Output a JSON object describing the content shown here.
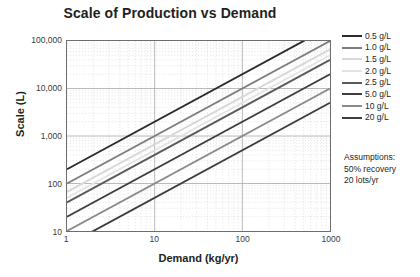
{
  "chart_data": {
    "type": "line",
    "title": "Scale of Production vs Demand",
    "xlabel": "Demand (kg/yr)",
    "ylabel": "Scale (L)",
    "xscale": "log",
    "yscale": "log",
    "xlim": [
      1,
      1000
    ],
    "ylim": [
      10,
      100000
    ],
    "xticks": [
      "1",
      "10",
      "100",
      "1000"
    ],
    "xtick_values": [
      1,
      10,
      100,
      1000
    ],
    "yticks": [
      "10",
      "100",
      "1,000",
      "10,000",
      "100,000"
    ],
    "ytick_values": [
      10,
      100,
      1000,
      10000,
      100000
    ],
    "grid": "major solid, minor dotted",
    "legend_position": "right outside",
    "series": [
      {
        "name": "0.5 g/L",
        "color": "#2b2b2b",
        "x": [
          1,
          1000
        ],
        "y": [
          200,
          200000
        ]
      },
      {
        "name": "1.0 g/L",
        "color": "#7d7d7d",
        "x": [
          1,
          1000
        ],
        "y": [
          100,
          100000
        ]
      },
      {
        "name": "1.5 g/L",
        "color": "#d8d8d8",
        "x": [
          1,
          1000
        ],
        "y": [
          66.7,
          66700
        ]
      },
      {
        "name": "2.0 g/L",
        "color": "#e3e3e3",
        "x": [
          1,
          1000
        ],
        "y": [
          50,
          50000
        ]
      },
      {
        "name": "2.5 g/L",
        "color": "#5a5a5a",
        "x": [
          1,
          1000
        ],
        "y": [
          40,
          40000
        ]
      },
      {
        "name": "5.0 g/L",
        "color": "#3d3d3d",
        "x": [
          1,
          1000
        ],
        "y": [
          20,
          20000
        ]
      },
      {
        "name": "10 g/L",
        "color": "#8a8a8a",
        "x": [
          1,
          1000
        ],
        "y": [
          10,
          10000
        ]
      },
      {
        "name": "20 g/L",
        "color": "#3d3d3d",
        "x": [
          1,
          1000
        ],
        "y": [
          5,
          5000
        ]
      }
    ],
    "annotations": {
      "assumptions_title": "Assumptions:",
      "assumptions_lines": [
        "50% recovery",
        "20 lots/yr"
      ]
    }
  },
  "colors": {
    "axis": "#6e6e6e",
    "major_grid": "#a8a8a8",
    "minor_grid": "#cfcfcf",
    "text": "#231f20",
    "tick_text": "#3a3a3a",
    "plot_background": "#ffffff"
  }
}
